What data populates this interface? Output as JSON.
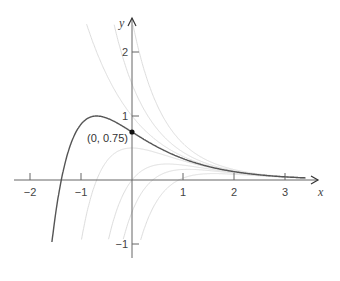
{
  "chart_data": {
    "type": "line",
    "title": "",
    "xlabel": "x",
    "ylabel": "y",
    "xlim": [
      -2.35,
      3.55
    ],
    "ylim": [
      -1.25,
      2.6
    ],
    "grid": false,
    "x_ticks": [
      -2,
      -1,
      1,
      2,
      3
    ],
    "x_tick_labels": [
      "−2",
      "−1",
      "1",
      "2",
      "3"
    ],
    "y_ticks": [
      -1,
      1,
      2
    ],
    "y_tick_labels": [
      "−1",
      "1",
      "2"
    ],
    "family_formula": "y = e^(-x) + C e^(-2x)",
    "highlight_series": {
      "name": "Particular solution (C = -0.25)",
      "C": -0.25,
      "x_range": [
        -1.57,
        3.4
      ],
      "color": "#555555"
    },
    "background_series": [
      {
        "name": "C = 0",
        "C": 0,
        "color": "#dddddd"
      },
      {
        "name": "C = 0.5",
        "C": 0.5,
        "color": "#dddddd"
      },
      {
        "name": "C = 1.5",
        "C": 1.5,
        "color": "#dddddd"
      },
      {
        "name": "C = -0.5",
        "C": -0.5,
        "color": "#dddddd"
      },
      {
        "name": "C = -1",
        "C": -1,
        "color": "#dddddd"
      },
      {
        "name": "C = -1.5",
        "C": -1.5,
        "color": "#dddddd"
      },
      {
        "name": "C = -2.5",
        "C": -2.5,
        "color": "#dddddd"
      }
    ],
    "annotations": [
      {
        "text": "(0, 0.75)",
        "x": 0,
        "y": 0.75,
        "marker": "dot"
      }
    ],
    "key_points": [
      {
        "label": "peak",
        "x": -0.69,
        "y": 1.0
      },
      {
        "label": "x-intercept",
        "x": -1.39,
        "y": 0
      },
      {
        "label": "y-intercept",
        "x": 0,
        "y": 0.75
      }
    ]
  },
  "labels": {
    "x_axis": "x",
    "y_axis": "y",
    "point": "(0, 0.75)"
  }
}
